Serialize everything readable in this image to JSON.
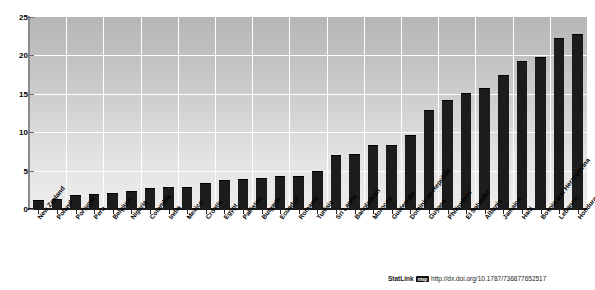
{
  "figure": {
    "title_partial": "",
    "statlink": {
      "label": "StatLink",
      "badge": "msp",
      "url": "http://dx.doi.org/10.1787/736877652517"
    }
  },
  "chart_data": {
    "type": "bar",
    "title": "",
    "xlabel": "",
    "ylabel": "",
    "ylim": [
      0,
      25
    ],
    "yticks": [
      0,
      5,
      10,
      15,
      20,
      25
    ],
    "grid": true,
    "legend": "none",
    "bar_color": "#1c1c1c",
    "plot_background": "#cccccc",
    "categories": [
      "New Zealand",
      "Poland",
      "Portugal",
      "Peru",
      "Belgium",
      "Nigeria",
      "Colombia",
      "India",
      "Mexico",
      "Croatia",
      "Egypt",
      "Pakistan",
      "Bulgaria",
      "Ecuador",
      "Romania",
      "Tunisia",
      "Sri Lanka",
      "Bangladesh",
      "Morocco",
      "Guatemala",
      "Dominican Republic",
      "Guyana",
      "Philippines",
      "El Salvador",
      "Albania",
      "Jamaica",
      "Haiti",
      "Bosnia and Herzegovina",
      "Lebanon",
      "Honduras"
    ],
    "values": [
      1.2,
      1.3,
      1.8,
      1.9,
      2.1,
      2.3,
      2.8,
      2.9,
      2.9,
      3.4,
      3.8,
      3.9,
      4.1,
      4.3,
      4.3,
      5.0,
      7.0,
      7.2,
      8.4,
      8.4,
      9.7,
      12.9,
      14.2,
      15.1,
      15.8,
      17.4,
      19.3,
      19.8,
      22.3,
      22.8
    ]
  }
}
